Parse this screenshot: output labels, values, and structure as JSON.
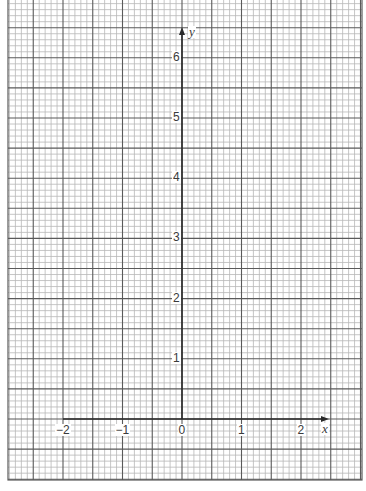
{
  "diagram": {
    "type": "graph-paper-axes",
    "colors": {
      "background": "#ffffff",
      "minor_line": "#b8b8b8",
      "major_line": "#5a5a5a",
      "axis": "#2a2a2a",
      "label": "#3a3a3a"
    },
    "grid": {
      "left": 8,
      "right": 362,
      "top": 0,
      "bottom": 480,
      "minor_spacing_px": 5.95,
      "minors_per_major": 5,
      "major_spacing_units": 0.5
    },
    "origin_px": {
      "x": 182,
      "y": 419
    },
    "unit_px": {
      "x": 59.5,
      "y": 60.2
    },
    "x_axis": {
      "label": "x",
      "from": -2,
      "arrow_at_px": 325,
      "ticks": [
        {
          "value": -2,
          "label": "−2"
        },
        {
          "value": -1,
          "label": "−1"
        },
        {
          "value": 0,
          "label": "0"
        },
        {
          "value": 1,
          "label": "1"
        },
        {
          "value": 2,
          "label": "2"
        }
      ]
    },
    "y_axis": {
      "label": "y",
      "from": 0,
      "arrow_at_px": 31,
      "ticks": [
        {
          "value": 1,
          "label": "1"
        },
        {
          "value": 2,
          "label": "2"
        },
        {
          "value": 3,
          "label": "3"
        },
        {
          "value": 4,
          "label": "4"
        },
        {
          "value": 5,
          "label": "5"
        },
        {
          "value": 6,
          "label": "6"
        }
      ]
    }
  }
}
